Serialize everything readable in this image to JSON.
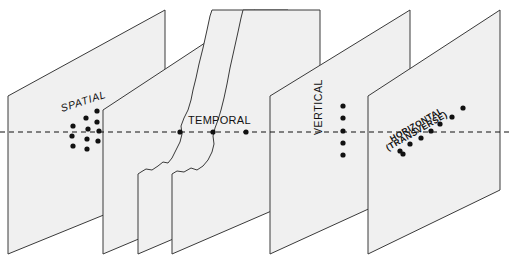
{
  "figure": {
    "background_color": "#ffffff",
    "panel_fill": "#f0f0f0",
    "panel_stroke": "#3a3a3a",
    "dot_color": "#111111",
    "axis_line_color": "#111111"
  },
  "axis": {
    "name": "horizontal-reference-line",
    "style": "dashed",
    "y": 132,
    "x_start": 0,
    "x_end": 511
  },
  "panels": [
    {
      "id": "panel-1",
      "label": "SPATIAL",
      "label_rotation": -18,
      "label_x": 62,
      "label_y": 112,
      "corners": "8,96 165,10 165,190 8,254",
      "has_torn_edge": false,
      "dot_pattern": "grid-3x4-scatter"
    },
    {
      "id": "panel-2",
      "label": "",
      "corners": "103,110 255,10 255,190 103,254",
      "has_torn_edge": false,
      "dot_pattern": "none"
    },
    {
      "id": "panel-3",
      "label": "",
      "corners": "138,174 288,10 288,190 138,254",
      "has_torn_edge": true,
      "dot_pattern": "none"
    },
    {
      "id": "panel-4",
      "label": "TEMPORAL",
      "label_rotation": 0,
      "label_x": 188,
      "label_y": 124,
      "corners": "172,174 320,10 320,190 172,254",
      "has_torn_edge": true,
      "dot_pattern": "row-3-horizontal"
    },
    {
      "id": "panel-5",
      "label": "VERTICAL",
      "label_rotation": -90,
      "label_x": 322,
      "label_y": 135,
      "corners": "270,96 410,10 410,190 270,254",
      "has_torn_edge": false,
      "dot_pattern": "column-5-vertical"
    },
    {
      "id": "panel-6",
      "label_line1": "HORIZONTAL",
      "label_line2": "(TRANSVERSE)",
      "label_rotation": -30,
      "label_x": 392,
      "label_y": 142,
      "corners": "368,96 500,10 500,190 368,254",
      "has_torn_edge": false,
      "dot_pattern": "diagonal-8"
    }
  ],
  "dots": {
    "spatial": [
      {
        "cx": 97,
        "cy": 111
      },
      {
        "cx": 86,
        "cy": 118
      },
      {
        "cx": 97,
        "cy": 122
      },
      {
        "cx": 73,
        "cy": 126
      },
      {
        "cx": 88,
        "cy": 129
      },
      {
        "cx": 99,
        "cy": 131
      },
      {
        "cx": 72,
        "cy": 136
      },
      {
        "cx": 87,
        "cy": 139
      },
      {
        "cx": 98,
        "cy": 141
      },
      {
        "cx": 73,
        "cy": 146
      },
      {
        "cx": 87,
        "cy": 149
      }
    ],
    "temporal": [
      {
        "cx": 180,
        "cy": 132
      },
      {
        "cx": 213,
        "cy": 132
      },
      {
        "cx": 246,
        "cy": 132
      }
    ],
    "vertical": [
      {
        "cx": 343,
        "cy": 106
      },
      {
        "cx": 343,
        "cy": 118
      },
      {
        "cx": 343,
        "cy": 131
      },
      {
        "cx": 343,
        "cy": 143
      },
      {
        "cx": 343,
        "cy": 155
      }
    ],
    "horizontal": [
      {
        "cx": 463,
        "cy": 108
      },
      {
        "cx": 452,
        "cy": 117
      },
      {
        "cx": 440,
        "cy": 124
      },
      {
        "cx": 431,
        "cy": 131
      },
      {
        "cx": 421,
        "cy": 138
      },
      {
        "cx": 410,
        "cy": 144
      },
      {
        "cx": 400,
        "cy": 151
      },
      {
        "cx": 403,
        "cy": 154
      }
    ]
  }
}
